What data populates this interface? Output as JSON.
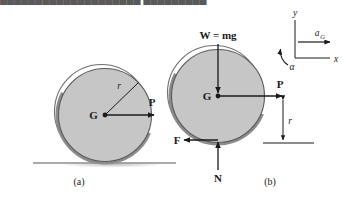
{
  "page": {
    "width": 346,
    "height": 201,
    "background_color": "#ffffff",
    "clipped_top_text": "████████████████████   █████████"
  },
  "colors": {
    "disc_fill": "#c6c6c6",
    "ring_dark": "#8a8a8a",
    "outline": "#555555",
    "arrow": "#1a1a1a",
    "ground": "#7c7c7c",
    "shadow": "#d6d6d6",
    "text": "#1a1a1a"
  },
  "figure_a": {
    "caption": "(a)",
    "center_label": "G",
    "radius_label": "r",
    "force_label": "P",
    "geometry": {
      "cx": 105,
      "cy": 115,
      "radius": 47
    }
  },
  "figure_b": {
    "caption": "(b)",
    "center_label": "G",
    "weight_label": "W = mg",
    "applied_force_label": "P",
    "friction_label": "F",
    "normal_label": "N",
    "radius_label": "r",
    "geometry": {
      "cx": 218,
      "cy": 96,
      "radius": 47
    }
  },
  "axes": {
    "y_label": "y",
    "x_label": "x",
    "acceleration_label": "a",
    "acceleration_subscript": "G",
    "angular_acceleration_label": "α"
  }
}
